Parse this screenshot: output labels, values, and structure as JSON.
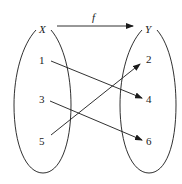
{
  "diagram": {
    "function_label": "f",
    "domain": {
      "label": "X",
      "elements": [
        "1",
        "3",
        "5"
      ]
    },
    "codomain": {
      "label": "Y",
      "elements": [
        "2",
        "4",
        "6"
      ]
    },
    "mappings": [
      {
        "from": "1",
        "to": "4"
      },
      {
        "from": "3",
        "to": "6"
      },
      {
        "from": "5",
        "to": "2"
      }
    ],
    "colors": {
      "stroke": "#1a1a1a",
      "background": "#ffffff"
    }
  }
}
